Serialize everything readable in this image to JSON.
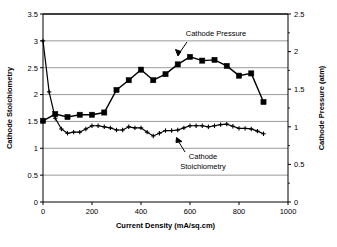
{
  "chart_data": {
    "type": "line",
    "title": "",
    "xlabel": "Current Density (mA/sq.cm)",
    "ylabel": "Cathode Stoichiometry",
    "y2label": "Cathode Pressure (atm)",
    "xlim": [
      0,
      1000
    ],
    "ylim": [
      0,
      3.5
    ],
    "y2lim": [
      0,
      2.5
    ],
    "xticks": [
      0,
      200,
      400,
      600,
      800,
      1000
    ],
    "xtick_labels": [
      "0",
      "200",
      "400",
      "600",
      "800",
      "1000"
    ],
    "yticks": [
      0,
      0.5,
      1,
      1.5,
      2,
      2.5,
      3,
      3.5
    ],
    "ytick_labels": [
      "0",
      "0.5",
      "1",
      "1.5",
      "2",
      "2.5",
      "3",
      "3.5"
    ],
    "y2ticks": [
      0,
      0.5,
      1,
      1.5,
      2,
      2.5
    ],
    "y2tick_labels": [
      "0",
      "0.5",
      "1",
      "1.5",
      "2",
      "2.5"
    ],
    "y2minor_step": 0.25,
    "grid": "horizontal",
    "legend_position": "inline-annotations",
    "series": [
      {
        "name": "Cathode Pressure",
        "axis": "right",
        "marker": "square",
        "units": "atm",
        "x": [
          0,
          50,
          100,
          150,
          200,
          250,
          300,
          350,
          400,
          450,
          500,
          550,
          600,
          650,
          700,
          750,
          800,
          850,
          900
        ],
        "values": [
          1.08,
          1.17,
          1.13,
          1.16,
          1.16,
          1.19,
          1.49,
          1.62,
          1.76,
          1.62,
          1.7,
          1.83,
          1.93,
          1.88,
          1.89,
          1.81,
          1.68,
          1.71,
          1.33
        ]
      },
      {
        "name": "Cathode Stoichiometry",
        "axis": "left",
        "marker": "plus",
        "units": "",
        "x": [
          0,
          25,
          50,
          75,
          100,
          125,
          150,
          175,
          200,
          225,
          250,
          275,
          300,
          325,
          350,
          375,
          400,
          425,
          450,
          475,
          500,
          525,
          550,
          575,
          600,
          625,
          650,
          675,
          700,
          725,
          750,
          775,
          800,
          825,
          850,
          875,
          900
        ],
        "values": [
          3.0,
          2.05,
          1.56,
          1.36,
          1.28,
          1.3,
          1.3,
          1.36,
          1.42,
          1.42,
          1.4,
          1.38,
          1.34,
          1.34,
          1.4,
          1.38,
          1.38,
          1.3,
          1.23,
          1.28,
          1.33,
          1.33,
          1.34,
          1.38,
          1.42,
          1.42,
          1.42,
          1.4,
          1.42,
          1.44,
          1.45,
          1.41,
          1.37,
          1.37,
          1.36,
          1.32,
          1.27
        ]
      }
    ],
    "annotations": [
      {
        "text": "Cathode Pressure",
        "lines": [
          "Cathode Pressure"
        ]
      },
      {
        "text": "Cathode Stoichiometry",
        "lines": [
          "Cathode",
          "Stoichiometry"
        ]
      }
    ]
  }
}
